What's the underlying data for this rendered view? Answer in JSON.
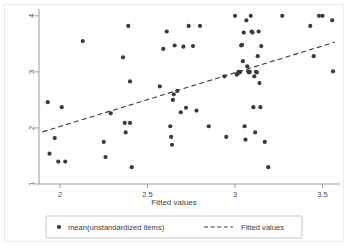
{
  "chart_data": {
    "type": "scatter",
    "title": "",
    "xlabel": "Fitted values",
    "ylabel": "",
    "xlim": [
      1.88,
      3.6
    ],
    "ylim": [
      1.0,
      4.05
    ],
    "xticks": [
      2,
      2.5,
      3,
      3.5
    ],
    "xticklabels": [
      "2",
      "2.5",
      "3",
      "3.5"
    ],
    "yticks": [
      1,
      2,
      3,
      4
    ],
    "yticklabels": [
      "1",
      "2",
      "3",
      "4"
    ],
    "grid": false,
    "legend_position": "below-outside",
    "series": [
      {
        "name": "mean(unstandardized items)",
        "type": "scatter",
        "marker": "circle",
        "color": "#3b3b3b",
        "points": [
          [
            1.93,
            2.46
          ],
          [
            1.94,
            1.54
          ],
          [
            1.97,
            1.82
          ],
          [
            1.99,
            1.4
          ],
          [
            2.01,
            2.37
          ],
          [
            2.03,
            1.4
          ],
          [
            2.13,
            3.55
          ],
          [
            2.25,
            1.75
          ],
          [
            2.26,
            1.48
          ],
          [
            2.29,
            2.26
          ],
          [
            2.36,
            3.26
          ],
          [
            2.37,
            2.09
          ],
          [
            2.375,
            1.92
          ],
          [
            2.39,
            3.82
          ],
          [
            2.4,
            2.83
          ],
          [
            2.4,
            2.09
          ],
          [
            2.41,
            1.3
          ],
          [
            2.57,
            2.74
          ],
          [
            2.59,
            3.41
          ],
          [
            2.61,
            3.72
          ],
          [
            2.63,
            2.03
          ],
          [
            2.635,
            1.84
          ],
          [
            2.64,
            1.7
          ],
          [
            2.645,
            2.5
          ],
          [
            2.65,
            2.6
          ],
          [
            2.655,
            3.47
          ],
          [
            2.67,
            2.66
          ],
          [
            2.69,
            2.28
          ],
          [
            2.705,
            3.45
          ],
          [
            2.72,
            2.36
          ],
          [
            2.735,
            3.82
          ],
          [
            2.76,
            3.46
          ],
          [
            2.78,
            2.31
          ],
          [
            2.8,
            3.82
          ],
          [
            2.85,
            2.03
          ],
          [
            2.94,
            2.92
          ],
          [
            2.95,
            1.84
          ],
          [
            3.0,
            4.0
          ],
          [
            3.01,
            2.95
          ],
          [
            3.015,
            2.97
          ],
          [
            3.02,
            3.0
          ],
          [
            3.025,
            2.99
          ],
          [
            3.03,
            3.0
          ],
          [
            3.035,
            3.47
          ],
          [
            3.04,
            3.48
          ],
          [
            3.045,
            3.19
          ],
          [
            3.05,
            3.7
          ],
          [
            3.055,
            2.03
          ],
          [
            3.06,
            1.79
          ],
          [
            3.065,
            3.92
          ],
          [
            3.07,
            3.1
          ],
          [
            3.075,
            3.01
          ],
          [
            3.08,
            2.99
          ],
          [
            3.085,
            3.0
          ],
          [
            3.09,
            4.0
          ],
          [
            3.095,
            3.72
          ],
          [
            3.1,
            3.7
          ],
          [
            3.105,
            2.37
          ],
          [
            3.11,
            2.92
          ],
          [
            3.115,
            1.92
          ],
          [
            3.12,
            3.0
          ],
          [
            3.125,
            2.99
          ],
          [
            3.13,
            3.28
          ],
          [
            3.135,
            3.72
          ],
          [
            3.14,
            2.8
          ],
          [
            3.145,
            2.37
          ],
          [
            3.15,
            3.46
          ],
          [
            3.17,
            1.75
          ],
          [
            3.19,
            1.3
          ],
          [
            3.27,
            4.0
          ],
          [
            3.43,
            3.82
          ],
          [
            3.45,
            3.28
          ],
          [
            3.48,
            4.0
          ],
          [
            3.5,
            4.0
          ],
          [
            3.555,
            3.92
          ],
          [
            3.56,
            3.01
          ]
        ]
      },
      {
        "name": "Fitted values",
        "type": "line",
        "style": "dashed",
        "color": "#3b3b3b",
        "endpoints": [
          [
            1.9,
            1.93
          ],
          [
            3.57,
            3.53
          ]
        ]
      }
    ]
  },
  "legend": {
    "marker_label": "mean(unstandardized items)",
    "line_label": "Fitted values"
  },
  "axes": {
    "x_title": "Fitted values"
  },
  "colors": {
    "marker": "#3b3b3b",
    "line": "#3b3b3b",
    "axis": "#9a9a9a",
    "text": "#3c3c3c",
    "background": "#ffffff"
  }
}
